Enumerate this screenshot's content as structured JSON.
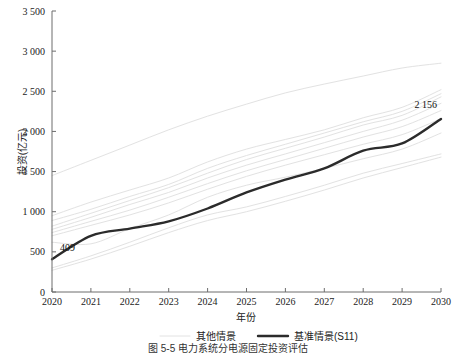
{
  "chart_data": {
    "type": "line",
    "title": "",
    "xlabel": "年份",
    "ylabel": "投资(亿元)",
    "xlim": [
      2020,
      2030
    ],
    "ylim": [
      0,
      3500
    ],
    "grid": false,
    "legend_position": "bottom",
    "x": [
      2020,
      2021,
      2022,
      2023,
      2024,
      2025,
      2026,
      2027,
      2028,
      2029,
      2030
    ],
    "x_tick_labels": [
      "2020",
      "2021",
      "2022",
      "2023",
      "2024",
      "2025",
      "2026",
      "2027",
      "2028",
      "2029",
      "2030"
    ],
    "y_ticks": [
      0,
      500,
      1000,
      1500,
      2000,
      2500,
      3000,
      3500
    ],
    "y_tick_labels": [
      "0",
      "500",
      "1 000",
      "1 500",
      "2 000",
      "2 500",
      "3 000",
      "3 500"
    ],
    "annotations": [
      {
        "text": "409",
        "x": 2020,
        "y": 409
      },
      {
        "text": "2 156",
        "x": 2030,
        "y": 2156
      }
    ],
    "series": [
      {
        "name": "基准情景(S11)",
        "style": "bold-dark",
        "color": "#2b2b2b",
        "values": [
          409,
          700,
          790,
          880,
          1040,
          1240,
          1400,
          1540,
          1760,
          1850,
          2156
        ]
      },
      {
        "name": "其他情景",
        "style": "light-gray",
        "color": "#e2e2e2",
        "values": [
          1450,
          1640,
          1830,
          2020,
          2190,
          2340,
          2480,
          2590,
          2690,
          2790,
          2850
        ]
      },
      {
        "name": "其他情景",
        "style": "light-gray",
        "color": "#e2e2e2",
        "values": [
          950,
          1120,
          1270,
          1420,
          1620,
          1780,
          1900,
          2020,
          2170,
          2300,
          2520
        ]
      },
      {
        "name": "其他情景",
        "style": "light-gray",
        "color": "#e2e2e2",
        "values": [
          890,
          1030,
          1190,
          1340,
          1540,
          1700,
          1840,
          1980,
          2120,
          2250,
          2470
        ]
      },
      {
        "name": "其他情景",
        "style": "light-gray",
        "color": "#e2e2e2",
        "values": [
          820,
          980,
          1140,
          1300,
          1480,
          1650,
          1790,
          1930,
          2080,
          2200,
          2430
        ]
      },
      {
        "name": "其他情景",
        "style": "light-gray",
        "color": "#e2e2e2",
        "values": [
          780,
          930,
          1090,
          1240,
          1420,
          1580,
          1720,
          1860,
          2000,
          2140,
          2350
        ]
      },
      {
        "name": "其他情景",
        "style": "light-gray",
        "color": "#e2e2e2",
        "values": [
          740,
          880,
          1020,
          1180,
          1350,
          1510,
          1650,
          1790,
          1930,
          2060,
          2260
        ]
      },
      {
        "name": "其他情景",
        "style": "light-gray",
        "color": "#e2e2e2",
        "values": [
          700,
          830,
          960,
          1110,
          1280,
          1440,
          1580,
          1710,
          1840,
          1960,
          2160
        ]
      },
      {
        "name": "其他情景",
        "style": "light-gray",
        "color": "#e2e2e2",
        "values": [
          620,
          600,
          790,
          960,
          1180,
          1330,
          1430,
          1540,
          1660,
          1780,
          1980
        ]
      },
      {
        "name": "其他情景",
        "style": "light-gray",
        "color": "#e2e2e2",
        "values": [
          300,
          450,
          620,
          800,
          960,
          1060,
          1190,
          1330,
          1480,
          1600,
          1720
        ]
      },
      {
        "name": "其他情景",
        "style": "light-gray",
        "color": "#e2e2e2",
        "values": [
          270,
          410,
          570,
          740,
          890,
          1000,
          1130,
          1270,
          1420,
          1550,
          1680
        ]
      }
    ]
  },
  "legend": {
    "items": [
      {
        "label": "其他情景",
        "marker": "light-line"
      },
      {
        "label": "基准情景(S11)",
        "marker": "bold-line"
      }
    ]
  },
  "caption": {
    "text": "图 5-5  电力系统分电源固定投资评估"
  }
}
